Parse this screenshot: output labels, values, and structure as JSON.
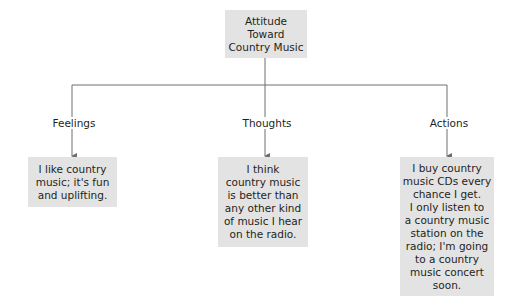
{
  "diagram": {
    "root": {
      "label": "Attitude\nToward\nCountry Music"
    },
    "branches": [
      {
        "name": "Feelings",
        "description": "I like country\nmusic; it's fun\nand uplifting."
      },
      {
        "name": "Thoughts",
        "description": "I think\ncountry music\nis better than\nany other kind\nof music I hear\non the radio."
      },
      {
        "name": "Actions",
        "description": "I buy country\nmusic CDs every\nchance I get.\nI only listen to\na country music\nstation on the\nradio; I'm going\nto a country\nmusic concert\nsoon."
      }
    ],
    "colors": {
      "box_fill": "#e3e3e3",
      "line": "#6d6e71",
      "text": "#231f20"
    }
  }
}
